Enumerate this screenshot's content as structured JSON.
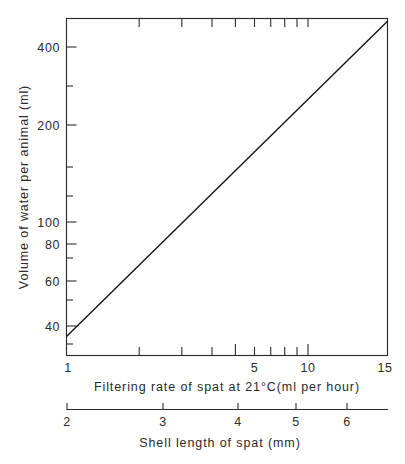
{
  "figure": {
    "background": "#ffffff",
    "line_color": "#111111",
    "axis_color": "#2b2b2b",
    "text_color": "#2a2a2a"
  },
  "chart_data": {
    "type": "line",
    "title": "",
    "subtitle": "",
    "xlabel": "Filtering rate of spat at 21°C(ml per hour)",
    "ylabel": "Volume of water per animal (ml)",
    "secondary_xlabel": "Shell length of spat (mm)",
    "xscale": "log",
    "yscale": "log",
    "xlim": [
      1,
      15
    ],
    "ylim": [
      30,
      460
    ],
    "grid": false,
    "legend": null,
    "x_tick_labels": [
      "1",
      "5",
      "10",
      "15"
    ],
    "x_tick_values": [
      1,
      5,
      10,
      15
    ],
    "x_minor_ticks": [
      2,
      3,
      4,
      6,
      7,
      8,
      9
    ],
    "y_tick_labels": [
      "400",
      "200",
      "100",
      "80",
      "60",
      "40"
    ],
    "y_tick_values": [
      400,
      200,
      100,
      80,
      60,
      40
    ],
    "y_minor_ticks": [
      50,
      70,
      90,
      150,
      300
    ],
    "secondary_x_tick_labels": [
      "2",
      "3",
      "4",
      "5",
      "6"
    ],
    "secondary_x_tick_values": [
      2,
      3,
      4,
      5,
      6
    ],
    "series": [
      {
        "name": "Volume of water per animal",
        "x": [
          1,
          2,
          3,
          4,
          5,
          6,
          7,
          8,
          9,
          10,
          12,
          15
        ],
        "y": [
          35,
          63,
          90,
          115,
          139,
          162,
          184,
          205,
          226,
          246,
          285,
          342
        ]
      }
    ],
    "line_endpoints": {
      "start": {
        "x": 1,
        "y": 35
      },
      "end": {
        "x": 15,
        "y": 450
      }
    },
    "annotations": []
  },
  "axes": {
    "y": {
      "label": "Volume of water per animal (ml)",
      "ticks": [
        {
          "label": "400",
          "value": 400
        },
        {
          "label": "200",
          "value": 200
        },
        {
          "label": "100",
          "value": 100
        },
        {
          "label": "80",
          "value": 80
        },
        {
          "label": "60",
          "value": 60
        },
        {
          "label": "40",
          "value": 40
        }
      ]
    },
    "x_primary": {
      "label": "Filtering rate of spat at 21°C(ml per hour)",
      "ticks": [
        {
          "label": "1",
          "value": 1
        },
        {
          "label": "5",
          "value": 5
        },
        {
          "label": "10",
          "value": 10
        },
        {
          "label": "15",
          "value": 15
        }
      ]
    },
    "x_secondary": {
      "label": "Shell length of spat (mm)",
      "ticks": [
        {
          "label": "2",
          "value": 2
        },
        {
          "label": "3",
          "value": 3
        },
        {
          "label": "4",
          "value": 4
        },
        {
          "label": "5",
          "value": 5
        },
        {
          "label": "6",
          "value": 6
        }
      ]
    }
  }
}
